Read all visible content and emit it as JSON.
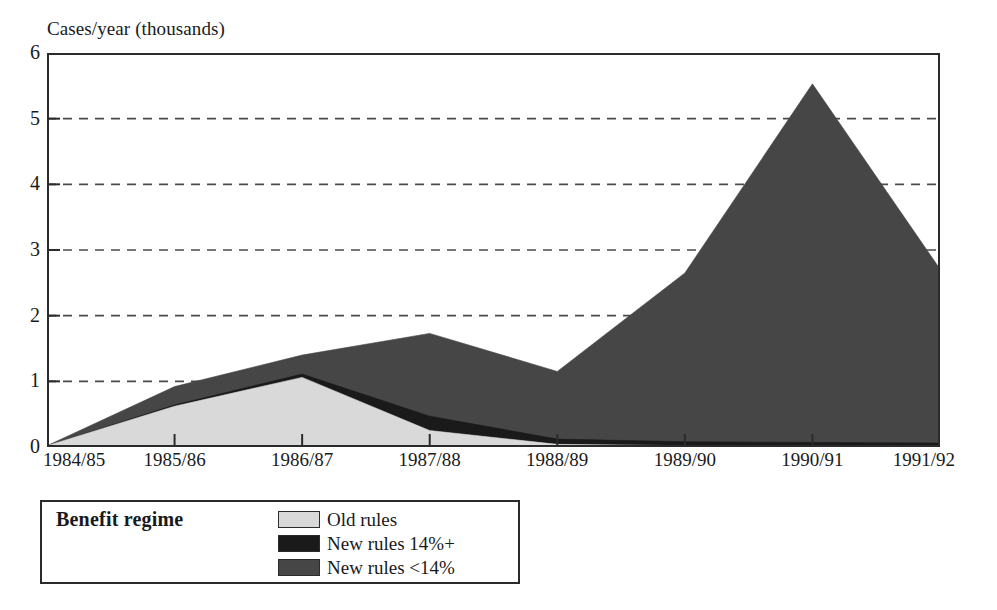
{
  "chart_data": {
    "type": "area",
    "stacked": true,
    "title": "",
    "subtitle": "",
    "xlabel": "",
    "ylabel": "Cases/year (thousands)",
    "categories": [
      "1984/85",
      "1985/86",
      "1986/87",
      "1987/88",
      "1988/89",
      "1989/90",
      "1990/91",
      "1991/92"
    ],
    "x_tick_labels": [
      "1984/85",
      "1985/86",
      "1986/87",
      "1987/88",
      "1988/89",
      "1989/90",
      "1990/91",
      "1991/92"
    ],
    "y_tick_labels": [
      "0",
      "1",
      "2",
      "3",
      "4",
      "5",
      "6"
    ],
    "y_ticks": [
      0,
      1,
      2,
      3,
      4,
      5,
      6
    ],
    "ylim": [
      0,
      6
    ],
    "grid": "horizontal-dashed",
    "legend_position": "below-left",
    "series": [
      {
        "name": "Old rules",
        "color": "#d9d9d9",
        "values": [
          0.02,
          0.62,
          1.06,
          0.25,
          0.04,
          0.02,
          0.02,
          0.02
        ]
      },
      {
        "name": "New rules 14%+",
        "color": "#1a1a1a",
        "values": [
          0.0,
          0.02,
          0.05,
          0.22,
          0.08,
          0.06,
          0.05,
          0.04
        ]
      },
      {
        "name": "New rules <14%",
        "color": "#464646",
        "values": [
          0.0,
          0.28,
          0.29,
          1.26,
          1.03,
          2.57,
          5.46,
          2.65
        ]
      }
    ],
    "stacked_totals": [
      0.02,
      0.92,
      1.4,
      1.73,
      1.15,
      2.65,
      5.53,
      2.71
    ],
    "annotations": []
  },
  "legend": {
    "title": "Benefit regime",
    "entries": [
      {
        "label": "Old rules",
        "color": "#d9d9d9"
      },
      {
        "label": "New rules 14%+",
        "color": "#1a1a1a"
      },
      {
        "label": "New rules <14%",
        "color": "#464646"
      }
    ]
  },
  "colors": {
    "axis": "#2b2b2b",
    "grid": "#4a4a4a",
    "background": "#ffffff",
    "old_rules": "#d9d9d9",
    "new_rules_high": "#1a1a1a",
    "new_rules_low": "#464646"
  }
}
